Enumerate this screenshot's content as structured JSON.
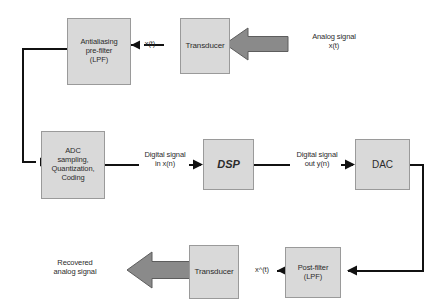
{
  "diagram": {
    "colors": {
      "box_fill": "#d9d9d9",
      "box_border": "#9a9a9a",
      "line": "#111111",
      "block_arrow_fill": "#8a8a8a",
      "block_arrow_border": "#5d5d5d",
      "text": "#2b2b2b",
      "background": "#ffffff"
    },
    "boxes": {
      "antialiasing": "Antialiasing\npre-filter\n(LPF)",
      "transducer_in": "Transducer",
      "adc": "ADC\nsampling,\nQuantization,\nCoding",
      "dsp": "DSP",
      "dac": "DAC",
      "post_filter": "Post-filter\n(LPF)",
      "transducer_out": "Transducer"
    },
    "labels": {
      "analog_in": "Analog signal\nx(t)",
      "xt": "x(t)",
      "digital_in": "Digital signal\nin x(n)",
      "digital_out": "Digital signal\nout y(n)",
      "x_hat_t": "x^(t)",
      "recovered": "Recovered\nanalog signal"
    }
  }
}
